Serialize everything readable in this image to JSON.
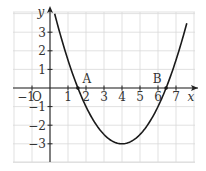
{
  "chart_data": {
    "type": "line",
    "title": "",
    "xlabel": "x",
    "ylabel": "y",
    "origin_label": "O",
    "xlim": [
      -0.7,
      8.3
    ],
    "ylim": [
      -4.0,
      4.1
    ],
    "grid": true,
    "x_ticks": [
      -1,
      1,
      2,
      3,
      4,
      5,
      6,
      7
    ],
    "x_tick_labels": [
      "−1",
      "1",
      "2",
      "3",
      "4",
      "5",
      "6",
      "7"
    ],
    "y_ticks": [
      3,
      2,
      1,
      -1,
      -2,
      -3
    ],
    "y_tick_labels": [
      "3",
      "2",
      "1",
      "−1",
      "−2",
      "−3"
    ],
    "series": [
      {
        "name": "parabola",
        "equation": "y = 0.5(x - 4)^2 - 3",
        "a": 0.5,
        "h": 4,
        "k": -3,
        "x_range": [
          0.26,
          7.6
        ]
      }
    ],
    "points": [
      {
        "label": "A",
        "x": 1.55,
        "y": 0
      },
      {
        "label": "B",
        "x": 6.45,
        "y": 0
      }
    ],
    "vertex": {
      "x": 4,
      "y": -3
    }
  }
}
